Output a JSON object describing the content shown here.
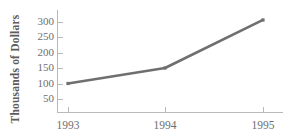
{
  "chart_data": {
    "type": "line",
    "title": "",
    "xlabel": "",
    "ylabel": "Thousands of Dollars",
    "categories": [
      "1993",
      "1994",
      "1995"
    ],
    "x": [
      1993,
      1994,
      1995
    ],
    "values": [
      100,
      150,
      305
    ],
    "series": [
      {
        "name": "Sales",
        "values": [
          100,
          150,
          305
        ]
      }
    ],
    "ylim": [
      0,
      325
    ],
    "yticks": [
      50,
      100,
      150,
      200,
      250,
      300
    ],
    "ytick_labels": [
      "50",
      "100",
      "150",
      "200",
      "250",
      "300"
    ],
    "xticks": [
      1993,
      1994,
      1995
    ],
    "xtick_labels": [
      "1993",
      "1994",
      "1995"
    ],
    "grid": false,
    "legend": false,
    "legend_position": "none",
    "line_color": "#6f6f6f",
    "axis_color": "#b9b9b9",
    "text_color": "#6e6e6e",
    "label_color": "#5d5d5d",
    "background": "#ffffff",
    "markers": true,
    "marker_shape": "square"
  },
  "axis": {
    "y_title": "Thousands of Dollars"
  }
}
